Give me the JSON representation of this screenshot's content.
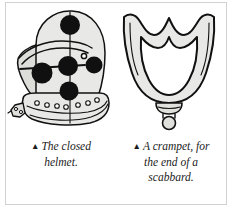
{
  "page": {
    "background_color": "#ffffff",
    "frame_color": "#d2d2d2"
  },
  "palette": {
    "ink": "#111111",
    "fill_light": "#e8e8e6",
    "fill_mid": "#d8d8d6",
    "dot": "#101010",
    "text": "#222222"
  },
  "figures": [
    {
      "name": "closed-helmet",
      "alt_label": "The closed helmet",
      "dot_count": 5,
      "rivet_count": 11
    },
    {
      "name": "crampet",
      "alt_label": "A crampet, for the end of a scabbard",
      "finial": true
    }
  ],
  "captions": [
    {
      "bullet": "▲",
      "lines": [
        "The closed",
        "helmet."
      ],
      "full_text": "The closed helmet."
    },
    {
      "bullet": "▲",
      "lines": [
        "A crampet, for",
        "the end of a",
        "scabbard."
      ],
      "full_text": "A crampet, for the end of a scabbard."
    }
  ]
}
